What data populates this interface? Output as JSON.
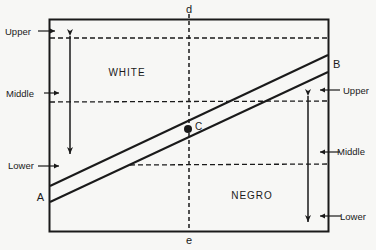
{
  "diagram": {
    "top_label": "d",
    "bottom_label": "e",
    "region_upper": "WHITE",
    "region_lower": "NEGRO",
    "point_left": "A",
    "point_right": "B",
    "point_center": "C",
    "left_scale": {
      "upper": "Upper",
      "middle": "Middle",
      "lower": "Lower"
    },
    "right_scale": {
      "upper": "Upper",
      "middle": "Middle",
      "lower": "Lower"
    }
  },
  "colors": {
    "background": "#f7f7f5",
    "ink": "#1a1a1a"
  }
}
